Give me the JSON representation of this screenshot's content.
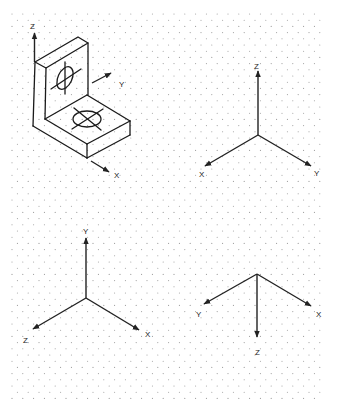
{
  "figure": {
    "type": "isometric-grid-worksheet",
    "background_color": "#ffffff",
    "line_color": "#1a1a1a",
    "grid_dot_color": "#9a9a9a"
  },
  "object": {
    "description": "L-shaped bracket with hole in vertical face and hole in horizontal base",
    "axis_labels": {
      "z": "Z",
      "y": "Y",
      "x": "X"
    }
  },
  "triads": [
    {
      "id": "triad-top-right",
      "labels": {
        "up": "Z",
        "left": "X",
        "right": "Y"
      }
    },
    {
      "id": "triad-bottom-left",
      "labels": {
        "up": "Y",
        "left": "Z",
        "right": "X"
      }
    },
    {
      "id": "triad-bottom-right",
      "labels": {
        "down": "Z",
        "left": "Y",
        "right": "X"
      }
    }
  ]
}
